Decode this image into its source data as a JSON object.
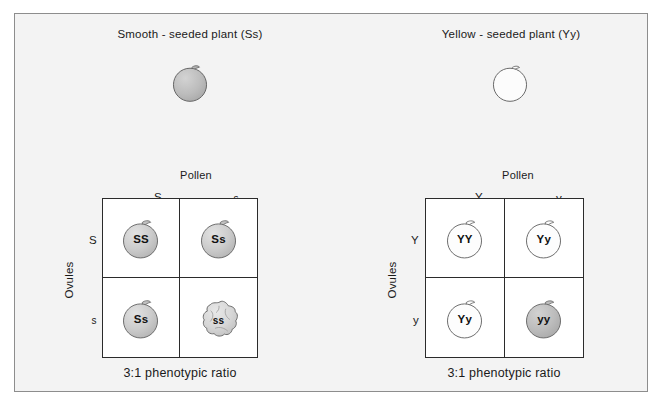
{
  "figure": {
    "background_color": "#f3f3f3",
    "border_color": "#8d8d8d",
    "line_color": "#2b2b2b"
  },
  "crosses": [
    {
      "id": "smooth",
      "title": "Smooth - seeded plant (Ss)",
      "parent_pea": {
        "icon": "pea-seed-smooth-icon",
        "shaded": true,
        "fill": "#b9b9b9"
      },
      "pollen_label": "Pollen",
      "ovules_label": "Ovules",
      "pollen_alleles": [
        "S",
        "s"
      ],
      "ovule_alleles": [
        "S",
        "s"
      ],
      "cells": [
        {
          "genotype": "SS",
          "icon": "pea-seed-smooth-icon",
          "shape": "smooth",
          "fill": "#c9c9c9"
        },
        {
          "genotype": "Ss",
          "icon": "pea-seed-smooth-icon",
          "shape": "smooth",
          "fill": "#c9c9c9"
        },
        {
          "genotype": "Ss",
          "icon": "pea-seed-smooth-icon",
          "shape": "smooth",
          "fill": "#c9c9c9"
        },
        {
          "genotype": "ss",
          "icon": "pea-seed-wrinkled-icon",
          "shape": "wrinkled",
          "fill": "#d7d7d7"
        }
      ],
      "ratio": "3:1 phenotypic ratio"
    },
    {
      "id": "yellow",
      "title": "Yellow - seeded plant (Yy)",
      "parent_pea": {
        "icon": "pea-seed-smooth-icon",
        "shaded": false,
        "fill": "#fdfdfd"
      },
      "pollen_label": "Pollen",
      "ovules_label": "Ovules",
      "pollen_alleles": [
        "Y",
        "y"
      ],
      "ovule_alleles": [
        "Y",
        "y"
      ],
      "cells": [
        {
          "genotype": "YY",
          "icon": "pea-seed-smooth-icon",
          "shape": "smooth",
          "fill": "#fdfdfd"
        },
        {
          "genotype": "Yy",
          "icon": "pea-seed-smooth-icon",
          "shape": "smooth",
          "fill": "#fdfdfd"
        },
        {
          "genotype": "Yy",
          "icon": "pea-seed-smooth-icon",
          "shape": "smooth",
          "fill": "#fdfdfd"
        },
        {
          "genotype": "yy",
          "icon": "pea-seed-smooth-icon",
          "shape": "smooth",
          "fill": "#b9b9b9"
        }
      ],
      "ratio": "3:1 phenotypic ratio"
    }
  ]
}
